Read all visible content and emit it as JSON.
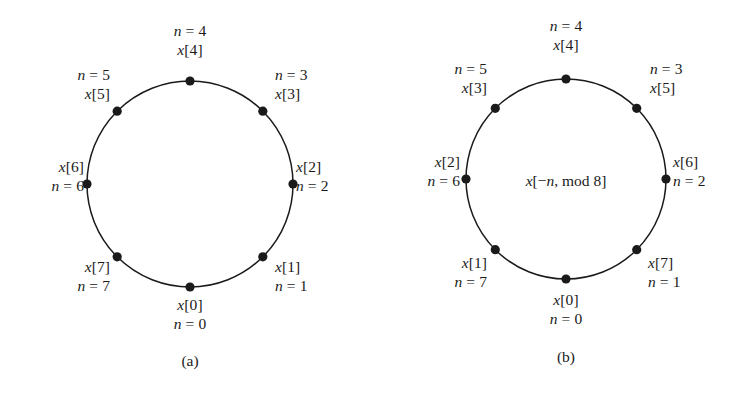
{
  "figure": {
    "background_color": "#ffffff",
    "ink_color": "#1a1a1a",
    "panels": [
      {
        "id": "a",
        "caption": "(a)",
        "center_note": "",
        "circle": {
          "cx": 190,
          "cy": 184,
          "r": 103
        },
        "caption_pos": {
          "x": 190,
          "y": 352
        },
        "nodes": [
          {
            "index": 0,
            "angle_deg": 270,
            "sample": "x[0]",
            "index_label": "n = 0",
            "label_lines": [
              "x[0]",
              "n = 0"
            ],
            "align": "center",
            "lx": 190,
            "ly": 296
          },
          {
            "index": 1,
            "angle_deg": 315,
            "sample": "x[1]",
            "index_label": "n = 1",
            "label_lines": [
              "x[1]",
              "n = 1"
            ],
            "align": "left",
            "lx": 275,
            "ly": 258
          },
          {
            "index": 2,
            "angle_deg": 0,
            "sample": "x[2]",
            "index_label": "n = 2",
            "label_lines": [
              "x[2]",
              "n = 2"
            ],
            "align": "left",
            "lx": 296,
            "ly": 158
          },
          {
            "index": 3,
            "angle_deg": 45,
            "sample": "x[3]",
            "index_label": "n = 3",
            "label_lines": [
              "n = 3",
              "x[3]"
            ],
            "align": "left",
            "lx": 275,
            "ly": 66
          },
          {
            "index": 4,
            "angle_deg": 90,
            "sample": "x[4]",
            "index_label": "n = 4",
            "label_lines": [
              "n = 4",
              "x[4]"
            ],
            "align": "center",
            "lx": 190,
            "ly": 22
          },
          {
            "index": 5,
            "angle_deg": 135,
            "sample": "x[5]",
            "index_label": "n = 5",
            "label_lines": [
              "n = 5",
              "x[5]"
            ],
            "align": "right",
            "lx": 110,
            "ly": 66
          },
          {
            "index": 6,
            "angle_deg": 180,
            "sample": "x[6]",
            "index_label": "n = 6",
            "label_lines": [
              "x[6]",
              "n = 6"
            ],
            "align": "right",
            "lx": 84,
            "ly": 158
          },
          {
            "index": 7,
            "angle_deg": 225,
            "sample": "x[7]",
            "index_label": "n = 7",
            "label_lines": [
              "x[7]",
              "n = 7"
            ],
            "align": "right",
            "lx": 110,
            "ly": 258
          }
        ]
      },
      {
        "id": "b",
        "caption": "(b)",
        "center_note": "x[−n, mod 8]",
        "center_note_pos": {
          "x": 566,
          "y": 181
        },
        "circle": {
          "cx": 566,
          "cy": 179,
          "r": 100
        },
        "caption_pos": {
          "x": 566,
          "y": 348
        },
        "nodes": [
          {
            "index": 0,
            "angle_deg": 270,
            "sample": "x[0]",
            "index_label": "n = 0",
            "label_lines": [
              "x[0]",
              "n = 0"
            ],
            "align": "center",
            "lx": 566,
            "ly": 291
          },
          {
            "index": 1,
            "angle_deg": 315,
            "sample": "x[7]",
            "index_label": "n = 1",
            "label_lines": [
              "x[7]",
              "n = 1"
            ],
            "align": "left",
            "lx": 648,
            "ly": 254
          },
          {
            "index": 2,
            "angle_deg": 0,
            "sample": "x[6]",
            "index_label": "n = 2",
            "label_lines": [
              "x[6]",
              "n = 2"
            ],
            "align": "left",
            "lx": 673,
            "ly": 153
          },
          {
            "index": 3,
            "angle_deg": 45,
            "sample": "x[5]",
            "index_label": "n = 3",
            "label_lines": [
              "n = 3",
              "x[5]"
            ],
            "align": "left",
            "lx": 650,
            "ly": 60
          },
          {
            "index": 4,
            "angle_deg": 90,
            "sample": "x[4]",
            "index_label": "n = 4",
            "label_lines": [
              "n = 4",
              "x[4]"
            ],
            "align": "center",
            "lx": 566,
            "ly": 17
          },
          {
            "index": 5,
            "angle_deg": 135,
            "sample": "x[3]",
            "index_label": "n = 5",
            "label_lines": [
              "n = 5",
              "x[3]"
            ],
            "align": "right",
            "lx": 487,
            "ly": 60
          },
          {
            "index": 6,
            "angle_deg": 180,
            "sample": "x[2]",
            "index_label": "n = 6",
            "label_lines": [
              "x[2]",
              "n = 6"
            ],
            "align": "right",
            "lx": 460,
            "ly": 153
          },
          {
            "index": 7,
            "angle_deg": 225,
            "sample": "x[1]",
            "index_label": "n = 7",
            "label_lines": [
              "x[1]",
              "n = 7"
            ],
            "align": "right",
            "lx": 487,
            "ly": 254
          }
        ]
      }
    ]
  },
  "chart_data": {
    "type": "scatter",
    "title": "",
    "subtitle": "",
    "xlabel": "",
    "ylabel": "",
    "grid": false,
    "legend": null,
    "panels": [
      {
        "name": "(a)",
        "center_annotation": "",
        "N": 8,
        "angles_deg": [
          270,
          315,
          0,
          45,
          90,
          135,
          180,
          225
        ],
        "n_values": [
          0,
          1,
          2,
          3,
          4,
          5,
          6,
          7
        ],
        "samples": [
          "x[0]",
          "x[1]",
          "x[2]",
          "x[3]",
          "x[4]",
          "x[5]",
          "x[6]",
          "x[7]"
        ],
        "mapping": "x[n]"
      },
      {
        "name": "(b)",
        "center_annotation": "x[−n, mod 8]",
        "N": 8,
        "angles_deg": [
          270,
          315,
          0,
          45,
          90,
          135,
          180,
          225
        ],
        "n_values": [
          0,
          1,
          2,
          3,
          4,
          5,
          6,
          7
        ],
        "samples": [
          "x[0]",
          "x[7]",
          "x[6]",
          "x[5]",
          "x[4]",
          "x[3]",
          "x[2]",
          "x[1]"
        ],
        "mapping": "x[-n, mod 8]"
      }
    ]
  }
}
